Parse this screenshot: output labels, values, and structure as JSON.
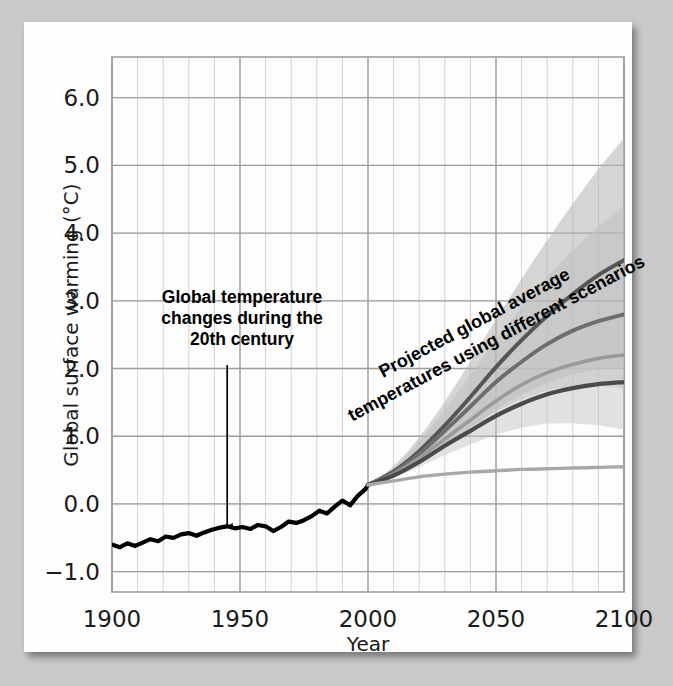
{
  "chart_data": {
    "type": "line",
    "title": "",
    "xlabel": "Year",
    "ylabel": "Global surface warming (°C)",
    "xlim": [
      1900,
      2100
    ],
    "ylim": [
      -1.3,
      6.6
    ],
    "xticks": [
      1900,
      1950,
      2000,
      2050,
      2100
    ],
    "yticks": [
      -1.0,
      0.0,
      1.0,
      2.0,
      3.0,
      4.0,
      5.0,
      6.0
    ],
    "ytick_labels": [
      "−1.0",
      "0.0",
      "1.0",
      "2.0",
      "3.0",
      "4.0",
      "5.0",
      "6.0"
    ],
    "xtick_labels": [
      "1900",
      "1950",
      "2000",
      "2050",
      "2100"
    ],
    "x_minor_step": 10,
    "y_minor_step": 1.0,
    "grid": true,
    "legend_position": "none",
    "annotations": [
      {
        "name": "historical-annotation",
        "text_lines": [
          "Global temperature",
          "changes during the",
          "20th century"
        ],
        "arrow": {
          "from_year": 1945,
          "from_value": 2.05,
          "to_year": 1945,
          "to_value": -0.33
        }
      },
      {
        "name": "projection-annotation",
        "text_lines": [
          "Projected global average",
          "temperatures using different scenarios"
        ],
        "rotation_deg": -28
      }
    ],
    "series": [
      {
        "name": "Observed 20th century",
        "period": "1900-2000",
        "color": "#000000",
        "width": 4.2,
        "band": null,
        "x": [
          1900,
          1903,
          1906,
          1909,
          1912,
          1915,
          1918,
          1921,
          1924,
          1927,
          1930,
          1933,
          1936,
          1939,
          1942,
          1945,
          1948,
          1951,
          1954,
          1957,
          1960,
          1963,
          1966,
          1969,
          1972,
          1975,
          1978,
          1981,
          1984,
          1987,
          1990,
          1993,
          1996,
          1999,
          2000
        ],
        "y": [
          -0.6,
          -0.64,
          -0.58,
          -0.62,
          -0.57,
          -0.52,
          -0.55,
          -0.48,
          -0.5,
          -0.45,
          -0.43,
          -0.47,
          -0.42,
          -0.38,
          -0.35,
          -0.33,
          -0.36,
          -0.34,
          -0.37,
          -0.31,
          -0.33,
          -0.4,
          -0.34,
          -0.26,
          -0.28,
          -0.24,
          -0.18,
          -0.1,
          -0.14,
          -0.04,
          0.05,
          -0.02,
          0.12,
          0.22,
          0.28
        ]
      },
      {
        "name": "A2",
        "period": "2000-2100",
        "color": "#555555",
        "width": 4.0,
        "end_value": 3.6,
        "band": {
          "low_2100": 2.0,
          "high_2100": 5.4,
          "color": "#b4b4b4",
          "opacity": 0.55
        },
        "x": [
          2000,
          2010,
          2020,
          2030,
          2040,
          2050,
          2060,
          2070,
          2080,
          2090,
          2100
        ],
        "y": [
          0.28,
          0.48,
          0.78,
          1.16,
          1.58,
          2.02,
          2.42,
          2.78,
          3.1,
          3.38,
          3.6
        ]
      },
      {
        "name": "A1B",
        "period": "2000-2100",
        "color": "#6d6d6d",
        "width": 4.0,
        "end_value": 2.8,
        "band": {
          "low_2100": 1.7,
          "high_2100": 4.4,
          "color": "#bdbdbd",
          "opacity": 0.5
        },
        "x": [
          2000,
          2010,
          2020,
          2030,
          2040,
          2050,
          2060,
          2070,
          2080,
          2090,
          2100
        ],
        "y": [
          0.28,
          0.46,
          0.74,
          1.08,
          1.44,
          1.8,
          2.1,
          2.36,
          2.56,
          2.7,
          2.8
        ]
      },
      {
        "name": "B2",
        "period": "2000-2100",
        "color": "#9a9a9a",
        "width": 3.6,
        "end_value": 2.2,
        "band": null,
        "x": [
          2000,
          2010,
          2020,
          2030,
          2040,
          2050,
          2060,
          2070,
          2080,
          2090,
          2100
        ],
        "y": [
          0.28,
          0.44,
          0.68,
          0.96,
          1.24,
          1.52,
          1.76,
          1.94,
          2.06,
          2.15,
          2.2
        ]
      },
      {
        "name": "B1",
        "period": "2000-2100",
        "color": "#4a4a4a",
        "width": 4.2,
        "end_value": 1.8,
        "band": {
          "low_2100": 1.1,
          "high_2100": 2.9,
          "color": "#c6c6c6",
          "opacity": 0.5
        },
        "x": [
          2000,
          2010,
          2020,
          2030,
          2040,
          2050,
          2060,
          2070,
          2080,
          2090,
          2100
        ],
        "y": [
          0.28,
          0.42,
          0.62,
          0.86,
          1.08,
          1.3,
          1.48,
          1.62,
          1.71,
          1.77,
          1.8
        ]
      },
      {
        "name": "Constant composition commitment",
        "period": "2000-2100",
        "color": "#a8a8a8",
        "width": 3.4,
        "end_value": 0.55,
        "band": null,
        "x": [
          2000,
          2010,
          2020,
          2030,
          2040,
          2050,
          2060,
          2070,
          2080,
          2090,
          2100
        ],
        "y": [
          0.28,
          0.34,
          0.4,
          0.44,
          0.47,
          0.49,
          0.51,
          0.52,
          0.53,
          0.54,
          0.55
        ]
      }
    ]
  },
  "colors": {
    "page_background": "#fdfdfd",
    "canvas_background": "#c9c9c9",
    "grid_major": "#9e9e9e",
    "grid_minor": "#d2d2d2",
    "axis_text": "#1a1a1a",
    "historical_line": "#000000"
  }
}
